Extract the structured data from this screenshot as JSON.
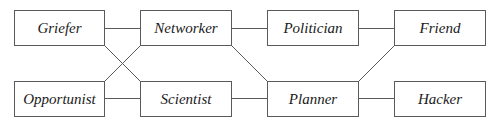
{
  "diagram": {
    "type": "graph",
    "nodes": [
      {
        "id": "griefer",
        "label": "Griefer",
        "x": 14,
        "y": 10,
        "w": 90,
        "h": 35
      },
      {
        "id": "networker",
        "label": "Networker",
        "x": 140,
        "y": 10,
        "w": 91,
        "h": 35
      },
      {
        "id": "politician",
        "label": "Politician",
        "x": 267,
        "y": 10,
        "w": 91,
        "h": 35
      },
      {
        "id": "friend",
        "label": "Friend",
        "x": 394,
        "y": 10,
        "w": 91,
        "h": 35
      },
      {
        "id": "opportunist",
        "label": "Opportunist",
        "x": 14,
        "y": 81,
        "w": 90,
        "h": 35
      },
      {
        "id": "scientist",
        "label": "Scientist",
        "x": 140,
        "y": 81,
        "w": 91,
        "h": 35
      },
      {
        "id": "planner",
        "label": "Planner",
        "x": 267,
        "y": 81,
        "w": 91,
        "h": 35
      },
      {
        "id": "hacker",
        "label": "Hacker",
        "x": 394,
        "y": 81,
        "w": 91,
        "h": 35
      }
    ],
    "edges": [
      {
        "from": "griefer",
        "to": "networker",
        "x1": 104,
        "y1": 28,
        "x2": 140,
        "y2": 28
      },
      {
        "from": "griefer",
        "to": "scientist",
        "x1": 104,
        "y1": 45,
        "x2": 140,
        "y2": 81
      },
      {
        "from": "opportunist",
        "to": "networker",
        "x1": 104,
        "y1": 81,
        "x2": 140,
        "y2": 45
      },
      {
        "from": "opportunist",
        "to": "scientist",
        "x1": 104,
        "y1": 98,
        "x2": 140,
        "y2": 98
      },
      {
        "from": "networker",
        "to": "politician",
        "x1": 231,
        "y1": 28,
        "x2": 267,
        "y2": 28
      },
      {
        "from": "networker",
        "to": "planner",
        "x1": 231,
        "y1": 45,
        "x2": 267,
        "y2": 81
      },
      {
        "from": "scientist",
        "to": "planner",
        "x1": 231,
        "y1": 98,
        "x2": 267,
        "y2": 98
      },
      {
        "from": "politician",
        "to": "friend",
        "x1": 358,
        "y1": 28,
        "x2": 394,
        "y2": 28
      },
      {
        "from": "planner",
        "to": "friend",
        "x1": 358,
        "y1": 81,
        "x2": 394,
        "y2": 45
      },
      {
        "from": "planner",
        "to": "hacker",
        "x1": 358,
        "y1": 98,
        "x2": 394,
        "y2": 98
      }
    ],
    "colors": {
      "stroke": "#5a5a5a",
      "text": "#1a1a1a",
      "background": "#ffffff"
    }
  }
}
